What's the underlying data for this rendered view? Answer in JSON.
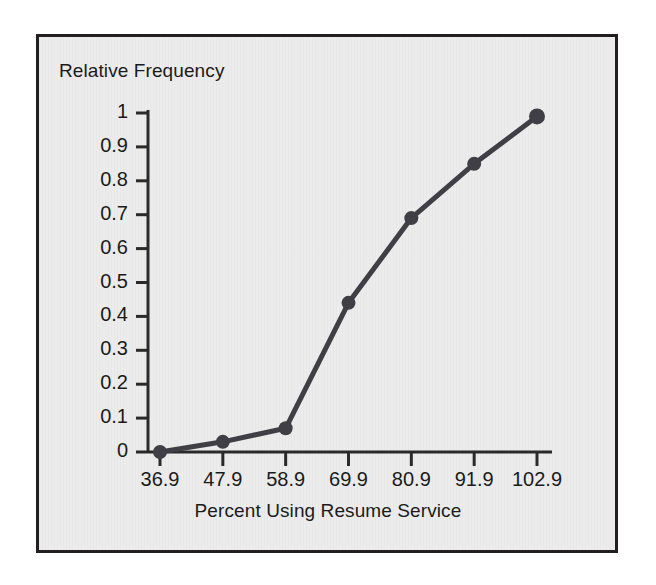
{
  "chart_data": {
    "type": "line",
    "title": "",
    "xlabel": "Percent Using Resume Service",
    "ylabel": "Relative Frequency",
    "categories": [
      "36.9",
      "47.9",
      "58.9",
      "69.9",
      "80.9",
      "91.9",
      "102.9"
    ],
    "x": [
      36.9,
      47.9,
      58.9,
      69.9,
      80.9,
      91.9,
      102.9
    ],
    "values": [
      0.0,
      0.03,
      0.07,
      0.44,
      0.69,
      0.85,
      0.99
    ],
    "ylim": [
      0,
      1
    ],
    "yticks": [
      "0",
      "0.1",
      "0.2",
      "0.3",
      "0.4",
      "0.5",
      "0.6",
      "0.7",
      "0.8",
      "0.9",
      "1"
    ],
    "ytick_values": [
      0,
      0.1,
      0.2,
      0.3,
      0.4,
      0.5,
      0.6,
      0.7,
      0.8,
      0.9,
      1
    ],
    "xtick_labels": [
      "36.9",
      "47.9",
      "58.9",
      "69.9",
      "80.9",
      "91.9",
      "102.9"
    ],
    "grid": false,
    "legend": null,
    "series": [
      {
        "name": "Relative Frequency",
        "values": [
          0.0,
          0.03,
          0.07,
          0.44,
          0.69,
          0.85,
          0.99
        ],
        "marker": "circle",
        "line_color": "#3f3f45",
        "marker_color": "#3f3f45"
      }
    ],
    "annotations": []
  },
  "style": {
    "plot_background": "#ececed",
    "frame_color": "#231f20",
    "axis_color": "#2a2a2a",
    "text_color": "#1b1b1b",
    "line_color": "#3f3f45"
  }
}
